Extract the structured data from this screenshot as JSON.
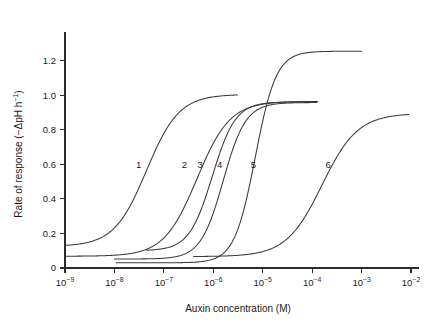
{
  "chart_data": {
    "type": "line",
    "title": "",
    "xlabel": "Auxin concentration (M)",
    "ylabel": "Rate of response (−ΔpH h⁻¹)",
    "ylabel_parts": {
      "main": "Rate of response (−ΔpH h",
      "sup": "−1",
      "tail": ")"
    },
    "x_scale": "log",
    "xlim": [
      1e-09,
      0.01
    ],
    "ylim": [
      0,
      1.32
    ],
    "grid": false,
    "legend": "inline-curve-numbers",
    "x_ticks": [
      {
        "value": 1e-09,
        "mantissa": "10",
        "exponent": "−9",
        "label": "10⁻⁹"
      },
      {
        "value": 1e-08,
        "mantissa": "10",
        "exponent": "−8",
        "label": "10⁻⁸"
      },
      {
        "value": 1e-07,
        "mantissa": "10",
        "exponent": "−7",
        "label": "10⁻⁷"
      },
      {
        "value": 1e-06,
        "mantissa": "10",
        "exponent": "−6",
        "label": "10⁻⁶"
      },
      {
        "value": 1e-05,
        "mantissa": "10",
        "exponent": "−5",
        "label": "10⁻⁵"
      },
      {
        "value": 0.0001,
        "mantissa": "10",
        "exponent": "−4",
        "label": "10⁻⁴"
      },
      {
        "value": 0.001,
        "mantissa": "10",
        "exponent": "−3",
        "label": "10⁻³"
      },
      {
        "value": 0.01,
        "mantissa": "10",
        "exponent": "−2",
        "label": "10⁻²"
      }
    ],
    "y_ticks": [
      {
        "value": 0,
        "label": "0"
      },
      {
        "value": 0.2,
        "label": "0.2"
      },
      {
        "value": 0.4,
        "label": "0.4"
      },
      {
        "value": 0.6,
        "label": "0.6"
      },
      {
        "value": 0.8,
        "label": "0.8"
      },
      {
        "value": 1.0,
        "label": "1.0"
      },
      {
        "value": 1.2,
        "label": "1.2"
      }
    ],
    "series": [
      {
        "name": "1",
        "label": "1",
        "label_x": 3.1e-08,
        "label_y": 0.6,
        "baseline": 0.125,
        "plateau": 1.005,
        "ec50_log": -7.35,
        "hill": 1.32,
        "x_start": 1e-09,
        "x_end": 3.1e-06,
        "color": "#3a3a3a",
        "values": [
          {
            "x": 1e-09,
            "y": 0.126
          },
          {
            "x": 1e-08,
            "y": 0.145
          },
          {
            "x": 3e-08,
            "y": 0.215
          },
          {
            "x": 1e-07,
            "y": 0.47
          },
          {
            "x": 2e-07,
            "y": 0.72
          },
          {
            "x": 5e-07,
            "y": 0.93
          },
          {
            "x": 1e-06,
            "y": 0.99
          },
          {
            "x": 3.1e-06,
            "y": 1.005
          }
        ]
      },
      {
        "name": "2",
        "label": "2",
        "label_x": 2.6e-07,
        "label_y": 0.6,
        "baseline": 0.068,
        "plateau": 0.965,
        "ec50_log": -6.33,
        "hill": 1.3,
        "x_start": 1e-09,
        "x_end": 0.00013,
        "color": "#3a3a3a",
        "values": [
          {
            "x": 1e-09,
            "y": 0.069
          },
          {
            "x": 1e-08,
            "y": 0.082
          },
          {
            "x": 1e-07,
            "y": 0.155
          },
          {
            "x": 5e-07,
            "y": 0.4
          },
          {
            "x": 1e-06,
            "y": 0.6
          },
          {
            "x": 5e-06,
            "y": 0.9
          },
          {
            "x": 1e-05,
            "y": 0.94
          },
          {
            "x": 0.00013,
            "y": 0.965
          }
        ]
      },
      {
        "name": "3",
        "label": "3",
        "label_x": 5.4e-07,
        "label_y": 0.6,
        "baseline": 0.1,
        "plateau": 0.962,
        "ec50_log": -6.02,
        "hill": 1.85,
        "x_start": 4.5e-08,
        "x_end": 0.00012,
        "color": "#3a3a3a",
        "values": [
          {
            "x": 4.5e-08,
            "y": 0.101
          },
          {
            "x": 3e-07,
            "y": 0.112
          },
          {
            "x": 1e-06,
            "y": 0.34
          },
          {
            "x": 2e-06,
            "y": 0.62
          },
          {
            "x": 5e-06,
            "y": 0.86
          },
          {
            "x": 2e-05,
            "y": 0.95
          },
          {
            "x": 0.00012,
            "y": 0.962
          }
        ]
      },
      {
        "name": "4",
        "label": "4",
        "label_x": 1.35e-06,
        "label_y": 0.6,
        "baseline": 0.052,
        "plateau": 0.958,
        "ec50_log": -5.8,
        "hill": 1.9,
        "x_start": 1e-08,
        "x_end": 0.000125,
        "color": "#3a3a3a",
        "values": [
          {
            "x": 1e-08,
            "y": 0.053
          },
          {
            "x": 3e-07,
            "y": 0.062
          },
          {
            "x": 1e-06,
            "y": 0.17
          },
          {
            "x": 3e-06,
            "y": 0.52
          },
          {
            "x": 8e-06,
            "y": 0.8
          },
          {
            "x": 3e-05,
            "y": 0.93
          },
          {
            "x": 0.000125,
            "y": 0.958
          }
        ]
      },
      {
        "name": "5",
        "label": "5",
        "label_x": 6.5e-06,
        "label_y": 0.6,
        "baseline": 0.03,
        "plateau": 1.255,
        "ec50_log": -5.15,
        "hill": 2.05,
        "x_start": 1.1e-08,
        "x_end": 0.001,
        "color": "#3a3a3a",
        "values": [
          {
            "x": 1.1e-08,
            "y": 0.031
          },
          {
            "x": 1e-06,
            "y": 0.045
          },
          {
            "x": 5e-06,
            "y": 0.23
          },
          {
            "x": 1e-05,
            "y": 0.55
          },
          {
            "x": 2e-05,
            "y": 0.95
          },
          {
            "x": 5e-05,
            "y": 1.18
          },
          {
            "x": 0.0002,
            "y": 1.25
          },
          {
            "x": 0.001,
            "y": 1.255
          }
        ]
      },
      {
        "name": "6",
        "label": "6",
        "label_x": 0.00021,
        "label_y": 0.6,
        "baseline": 0.066,
        "plateau": 0.895,
        "ec50_log": -3.8,
        "hill": 1.2,
        "x_start": 4e-07,
        "x_end": 0.009,
        "color": "#3a3a3a",
        "values": [
          {
            "x": 4e-07,
            "y": 0.067
          },
          {
            "x": 1e-05,
            "y": 0.095
          },
          {
            "x": 0.0001,
            "y": 0.33
          },
          {
            "x": 0.0003,
            "y": 0.56
          },
          {
            "x": 0.001,
            "y": 0.76
          },
          {
            "x": 0.003,
            "y": 0.86
          },
          {
            "x": 0.009,
            "y": 0.895
          }
        ]
      }
    ]
  }
}
